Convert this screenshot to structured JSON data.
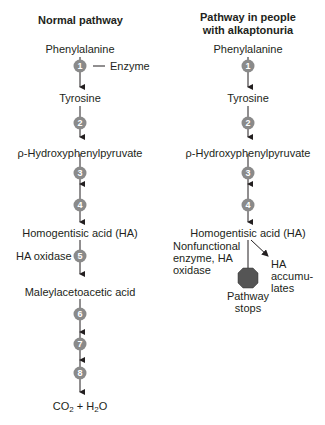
{
  "left": {
    "title": "Normal pathway",
    "compounds": [
      "Phenylalanine",
      "Tyrosine",
      "ρ-Hydroxyphenylpyruvate",
      "Homogentisic acid (HA)",
      "Maleylacetoacetic acid"
    ],
    "final_product": {
      "co2": "CO",
      "sub1": "2",
      "plus": " + H",
      "sub2": "2",
      "o": "O"
    },
    "enzyme_label": "Enzyme",
    "ha_oxidase_label": "HA oxidase",
    "steps": [
      "1",
      "2",
      "3",
      "4",
      "5",
      "6",
      "7",
      "8"
    ]
  },
  "right": {
    "title_line1": "Pathway in people",
    "title_line2": "with alkaptonuria",
    "compounds": [
      "Phenylalanine",
      "Tyrosine",
      "ρ-Hydroxyphenylpyruvate",
      "Homogentisic acid (HA)"
    ],
    "steps": [
      "1",
      "2",
      "3",
      "4"
    ],
    "nonfunctional_line1": "Nonfunctional",
    "nonfunctional_line2": "enzyme, HA",
    "nonfunctional_line3": "oxidase",
    "accumulates_line1": "HA",
    "accumulates_line2": "accumu-",
    "accumulates_line3": "lates",
    "stops_line1": "Pathway",
    "stops_line2": "stops"
  },
  "colors": {
    "step_circle": "#8a8a8a",
    "stop_sign": "#555555",
    "line": "#231f20"
  }
}
